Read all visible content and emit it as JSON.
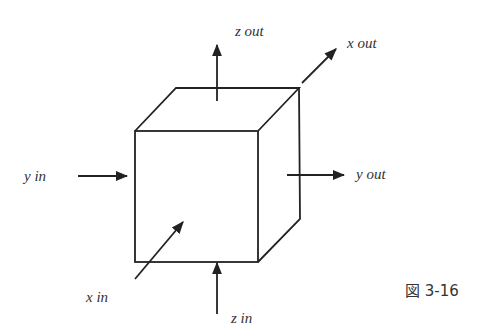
{
  "diagram": {
    "shape": "cube",
    "stroke_color": "#222222",
    "labels": {
      "z_out": "z out",
      "x_out": "x out",
      "y_in": "y in",
      "y_out": "y out",
      "x_in": "x in",
      "z_in": "z in"
    },
    "caption": "図 3-16"
  }
}
